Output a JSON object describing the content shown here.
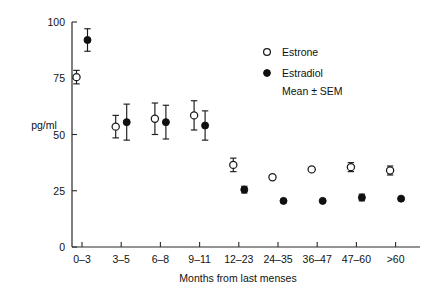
{
  "chart_data": {
    "type": "scatter",
    "title": "",
    "xlabel": "Months from last menses",
    "ylabel": "pg/ml",
    "categories": [
      "0–3",
      "3–5",
      "6–8",
      "9–11",
      "12–23",
      "24–35",
      "36–47",
      "47–60",
      ">60"
    ],
    "ylim": [
      0,
      100
    ],
    "yticks": [
      0,
      25,
      50,
      75,
      100
    ],
    "ytick_labels": [
      "0",
      "25",
      "50",
      "75",
      "100"
    ],
    "grid": false,
    "legend_position": "upper-right",
    "error_type": "SEM",
    "series": [
      {
        "name": "Estrone",
        "marker": "open-circle",
        "values": [
          75.5,
          53.5,
          57.0,
          58.5,
          36.5,
          31.0,
          34.5,
          35.5,
          34.0
        ],
        "errors": [
          3.0,
          5.0,
          7.0,
          6.5,
          3.0,
          0.0,
          0.0,
          2.0,
          2.0
        ]
      },
      {
        "name": "Estradiol",
        "marker": "filled-circle",
        "values": [
          92.0,
          55.5,
          55.5,
          54.0,
          25.5,
          20.5,
          20.5,
          22.0,
          21.5
        ],
        "errors": [
          5.0,
          8.0,
          7.5,
          6.5,
          1.5,
          0.0,
          0.0,
          1.5,
          0.0
        ]
      }
    ]
  },
  "legend": {
    "items": [
      {
        "label": "Estrone",
        "marker": "open-circle"
      },
      {
        "label": "Estradiol",
        "marker": "filled-circle"
      }
    ],
    "note": "Mean ± SEM"
  },
  "axes": {
    "y_label": "pg/ml",
    "x_label": "Months from last menses"
  }
}
